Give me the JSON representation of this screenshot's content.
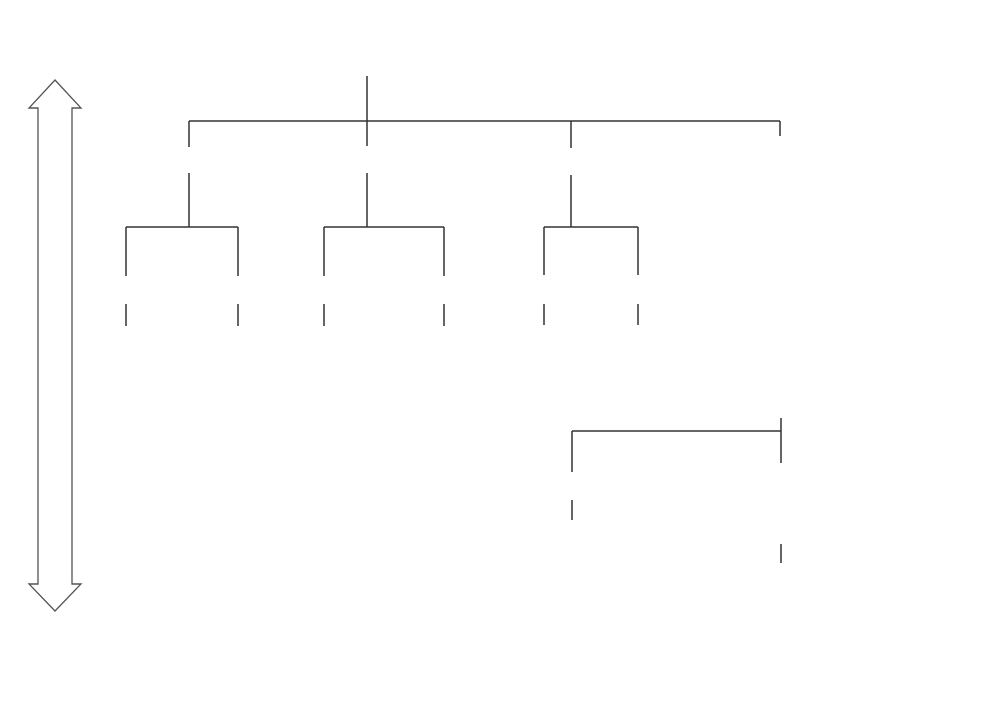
{
  "diagram": {
    "stacked_headers": {
      "primary": "PROCUREMENT COMPLEXITY",
      "secondary": "OPERATIONAL COMPLEXITY",
      "tertiary": "DISPOSAL COMPLEXITY"
    },
    "branches": [
      {
        "label": "Tasks",
        "children": [
          {
            "label": "Diff.",
            "outcome": "K/U"
          },
          {
            "label": "Interdep.",
            "outcome": "K/U"
          }
        ]
      },
      {
        "label": "Technologies",
        "children": [
          {
            "label": "Diff.",
            "outcome": "K/U"
          },
          {
            "label": "Interdep.",
            "outcome": "K/U"
          }
        ]
      },
      {
        "label": "Resources",
        "children": [
          {
            "label": "Diff.",
            "outcome": "K/U"
          },
          {
            "label": "Interdep.",
            "outcome": "K/U"
          }
        ]
      }
    ],
    "organisation": {
      "title": "Organisation",
      "items": [
        "Structure",
        "Governance",
        "Stakeholder management",
        "Quality management",
        "HR management",
        "Resource management",
        "Comm. & IT management",
        "Supply chain management",
        "Value management",
        "Financial management",
        "Cost management",
        "Risk management",
        "Facility/asset management"
      ],
      "differentiation": {
        "title": "Differentiation",
        "outcome": "Known/uncertain"
      },
      "interdependency": {
        "title": "Interdependency",
        "items": [
          "Pooled",
          "Sequential",
          "Reciprocal"
        ],
        "outcome": "Known/uncertain"
      }
    },
    "axes": {
      "vertical": "DECISION MAKING",
      "horizontal": "DYNAMIC (TIME/CHANGE)"
    },
    "colors": {
      "line": "#333333",
      "shadow_light": "#ececec",
      "shadow_dark": "#c8c8c8",
      "background": "#ffffff"
    }
  }
}
